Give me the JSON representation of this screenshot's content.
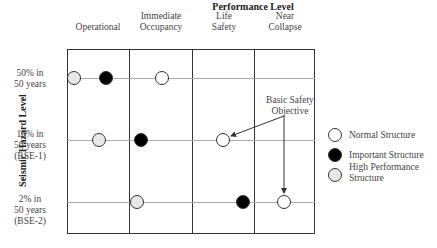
{
  "title": "Performance Level",
  "y_axis_label": "Seismic Hazard Level",
  "columns": [
    {
      "line1": "",
      "line2": "Operational"
    },
    {
      "line1": "Immediate",
      "line2": "Occupancy"
    },
    {
      "line1": "Life",
      "line2": "Safety"
    },
    {
      "line1": "Near",
      "line2": "Collapse"
    }
  ],
  "rows": [
    {
      "line1": "50% in",
      "line2": "50 years",
      "line3": ""
    },
    {
      "line1": "10% in",
      "line2": "50 years",
      "line3": "(BSE-1)"
    },
    {
      "line1": "2% in",
      "line2": "50 years",
      "line3": "(BSE-2)"
    }
  ],
  "annotation": {
    "line1": "Basic Safety",
    "line2": "Objective"
  },
  "legend": [
    {
      "type": "normal",
      "line1": "Normal Structure",
      "line2": ""
    },
    {
      "type": "important",
      "line1": "Important Structure",
      "line2": ""
    },
    {
      "type": "high",
      "line1": "High Performance",
      "line2": "Structure"
    }
  ],
  "points": [
    {
      "row": "50% in 50 years",
      "position": "Operational (left edge)",
      "type": "high"
    },
    {
      "row": "50% in 50 years",
      "position": "Operational",
      "type": "important"
    },
    {
      "row": "50% in 50 years",
      "position": "Immediate Occupancy",
      "type": "normal"
    },
    {
      "row": "10% in 50 years (BSE-1)",
      "position": "Operational",
      "type": "high"
    },
    {
      "row": "10% in 50 years (BSE-1)",
      "position": "Immediate Occupancy (left edge)",
      "type": "important"
    },
    {
      "row": "10% in 50 years (BSE-1)",
      "position": "Life Safety",
      "type": "normal"
    },
    {
      "row": "2% in 50 years (BSE-2)",
      "position": "Immediate Occupancy (left edge)",
      "type": "high"
    },
    {
      "row": "2% in 50 years (BSE-2)",
      "position": "Life Safety (right edge)",
      "type": "important"
    },
    {
      "row": "2% in 50 years (BSE-2)",
      "position": "Near Collapse",
      "type": "normal"
    }
  ]
}
